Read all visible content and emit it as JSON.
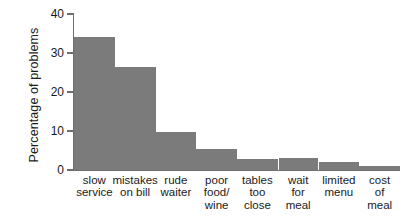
{
  "chart_data": {
    "type": "bar",
    "title": "",
    "subtitle": "",
    "xlabel": "",
    "ylabel": "Percentage of problems",
    "ylim": [
      0,
      40
    ],
    "yticks": [
      0,
      10,
      20,
      30,
      40
    ],
    "ytick_labels": [
      "0",
      "10",
      "20",
      "30",
      "40"
    ],
    "grid": false,
    "legend": null,
    "bar_color": "#7b7b7b",
    "axis_color": "#6e6e6e",
    "style": "histogram-adjacent-bars",
    "categories": [
      "slow service",
      "mistakes on bill",
      "rude waiter",
      "poor food/ wine",
      "tables too close",
      "wait for meal",
      "limited menu",
      "cost of meal"
    ],
    "category_lines": [
      [
        "slow",
        "service"
      ],
      [
        "mistakes",
        "on bill"
      ],
      [
        "rude",
        "waiter"
      ],
      [
        "poor",
        "food/",
        "wine"
      ],
      [
        "tables",
        "too",
        "close"
      ],
      [
        "wait",
        "for",
        "meal"
      ],
      [
        "limited",
        "menu"
      ],
      [
        "cost",
        "of",
        "meal"
      ]
    ],
    "values": [
      34,
      26.5,
      9.8,
      5.5,
      2.8,
      3.0,
      2.0,
      1.0
    ]
  }
}
